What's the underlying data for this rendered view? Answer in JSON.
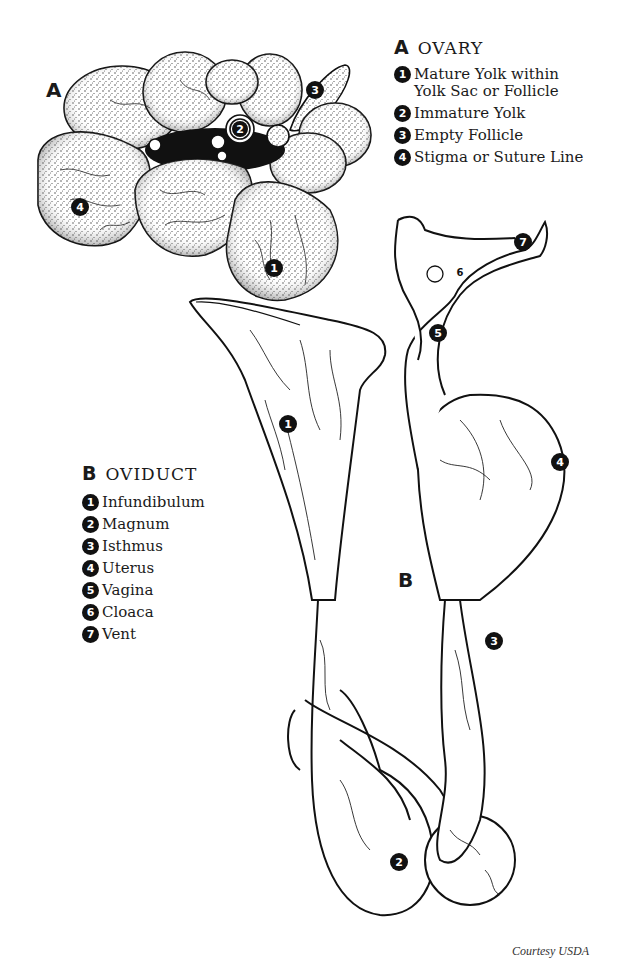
{
  "figure": {
    "type": "anatomical-illustration",
    "colors": {
      "ink": "#111111",
      "background": "#ffffff"
    }
  },
  "ovary": {
    "diagram_letter": "A",
    "legend": {
      "letter": "A",
      "title": "OVARY",
      "items": [
        {
          "number": "1",
          "label": "Mature Yolk within\nYolk Sac or Follicle"
        },
        {
          "number": "2",
          "label": "Immature Yolk"
        },
        {
          "number": "3",
          "label": "Empty Follicle"
        },
        {
          "number": "4",
          "label": "Stigma or Suture Line"
        }
      ]
    },
    "callouts": [
      "1",
      "2",
      "3",
      "4"
    ]
  },
  "oviduct": {
    "diagram_letter": "B",
    "legend": {
      "letter": "B",
      "title": "OVIDUCT",
      "items": [
        {
          "number": "1",
          "label": "Infundibulum"
        },
        {
          "number": "2",
          "label": "Magnum"
        },
        {
          "number": "3",
          "label": "Isthmus"
        },
        {
          "number": "4",
          "label": "Uterus"
        },
        {
          "number": "5",
          "label": "Vagina"
        },
        {
          "number": "6",
          "label": "Cloaca"
        },
        {
          "number": "7",
          "label": "Vent"
        }
      ]
    },
    "callouts": [
      "1",
      "2",
      "3",
      "4",
      "5",
      "6",
      "7"
    ]
  },
  "credit": "Courtesy USDA"
}
